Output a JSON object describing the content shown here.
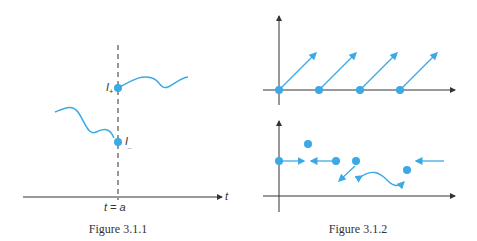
{
  "figures": [
    {
      "caption": "Figure 3.1.1",
      "labels": {
        "t_axis": "t",
        "t_equals_a": "t = a",
        "I_plus": "I",
        "I_plus_sub": "+",
        "I_minus": "I",
        "I_minus_sub": "_"
      }
    },
    {
      "caption": "Figure 3.1.2"
    }
  ],
  "colors": {
    "accent": "#3aa9e6",
    "axis": "#333333"
  }
}
